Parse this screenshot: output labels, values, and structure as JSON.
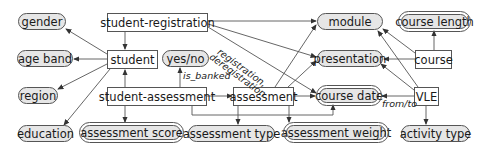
{
  "diagram": {
    "entities": {
      "student_registration": "student-registration",
      "student": "student",
      "student_assessment": "student-assessment",
      "assessment": "assessment",
      "course": "course",
      "vle": "VLE"
    },
    "attributes": {
      "gender": "gender",
      "age_band": "age band",
      "region": "region",
      "education": "education",
      "yes_no": "yes/no",
      "module": "module",
      "presentation": "presentation",
      "course_date": "course date",
      "course_length": "course length",
      "assessment_score": "assessment score",
      "assessment_type": "assessment type",
      "assessment_weight": "assessment weight",
      "activity_type": "activity type"
    },
    "edge_labels": {
      "is_banked": "is_banked",
      "registration": "registration,",
      "deregistration": "deregistration",
      "from_to": "from/to"
    },
    "colors": {
      "attribute_fill": "#e6e6e6",
      "entity_fill": "#ffffff",
      "stroke": "#555555"
    }
  }
}
